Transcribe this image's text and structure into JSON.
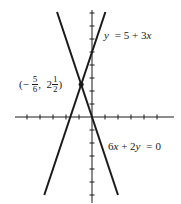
{
  "chart_data": {
    "type": "line",
    "title": "",
    "xlabel": "",
    "ylabel": "",
    "grid": false,
    "axes": {
      "origin_px": [
        92,
        117
      ],
      "unit_px": 13,
      "x_ticks": [
        -5,
        -4,
        -3,
        -2,
        -1,
        1,
        2,
        3,
        4,
        5
      ],
      "y_ticks": [
        -6,
        -5,
        -4,
        -3,
        -2,
        -1,
        1,
        2,
        3,
        4,
        5,
        6,
        7,
        8
      ],
      "xlim": [
        -6.5,
        6.8
      ],
      "ylim": [
        -6.6,
        8.5
      ]
    },
    "series": [
      {
        "name": "y = 5 + 3x",
        "slope": 3,
        "intercept": 5,
        "x": [
          -3.67,
          1.03
        ],
        "y": [
          -6,
          8.08
        ]
      },
      {
        "name": "6x + 2y = 0",
        "slope": -3,
        "intercept": 0,
        "x": [
          -2.69,
          2
        ],
        "y": [
          8.08,
          -6
        ]
      }
    ],
    "annotations": [
      {
        "type": "point",
        "label": "(-5/6, 2 1/2)",
        "x": -0.8333,
        "y": 2.5
      }
    ]
  },
  "labels": {
    "line1": {
      "y": "y",
      "eq": "=",
      "rhs": "5 + 3",
      "x": "x"
    },
    "line2": {
      "a": "6",
      "x": "x",
      "plus": "+ 2",
      "y": "y",
      "eq": "=",
      "rhs": "0"
    },
    "point": {
      "open": "(−",
      "x_num": "5",
      "x_den": "6",
      "comma": ",  2",
      "y_num": "1",
      "y_den": "2",
      "close": ")"
    }
  },
  "colors": {
    "ink": "#1a1a1a",
    "background": "#ffffff"
  }
}
